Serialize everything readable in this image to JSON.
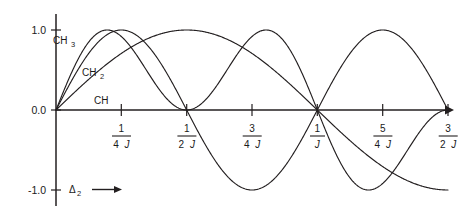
{
  "chart_data": {
    "type": "line",
    "title": "",
    "xlabel": "Δ₂",
    "ylabel": "",
    "xlim": [
      0,
      1.5
    ],
    "ylim": [
      -1.25,
      1.25
    ],
    "grid": false,
    "legend": "inline-curve-labels",
    "x_unit": "1/J",
    "x_tick_labels": [
      "1/4J",
      "1/2J",
      "3/4J",
      "1/J",
      "5/4J",
      "3/2J"
    ],
    "x_tick_values": [
      0.25,
      0.5,
      0.75,
      1.0,
      1.25,
      1.5
    ],
    "y_tick_labels": [
      "1.0",
      "0.0",
      "-1.0"
    ],
    "y_tick_values": [
      1.0,
      0.0,
      -1.0
    ],
    "series": [
      {
        "name": "CH",
        "formula": "sin(pi*J*D)",
        "peak_value": 1.0,
        "peak_x": "1/2J",
        "zero_crossings": [
          "0",
          "1/J"
        ],
        "min_value": -1.0,
        "min_x": "3/2J"
      },
      {
        "name": "CH2",
        "formula": "sin(2*pi*J*D)",
        "peak_value": 1.0,
        "peak_x": "1/4J",
        "zero_crossings": [
          "0",
          "1/2J",
          "1/J",
          "3/2J"
        ],
        "min_value": -1.0,
        "min_x": "3/4J"
      },
      {
        "name": "CH3",
        "formula": "sin(pi*J*D)*cos(pi*J*D)^2 scaled",
        "peak_value": 1.15,
        "peak_x": "~0.2/J",
        "zero_crossings": [
          "0",
          "1/2J",
          "1/J",
          "3/2J"
        ],
        "min_value": -1.15,
        "min_x": "~1.3/J"
      }
    ]
  },
  "axis": {
    "y_labels": [
      "1.0",
      "0.0",
      "-1.0"
    ],
    "x_axis_name": "Δ",
    "x_axis_subscript": "2",
    "x_axis_arrow": "⟶"
  },
  "ticks": [
    {
      "num": "1",
      "den_num": "4",
      "den_J": "J"
    },
    {
      "num": "1",
      "den_num": "2",
      "den_J": "J"
    },
    {
      "num": "3",
      "den_num": "4",
      "den_J": "J"
    },
    {
      "num": "1",
      "den_num": "",
      "den_J": "J"
    },
    {
      "num": "5",
      "den_num": "4",
      "den_J": "J"
    },
    {
      "num": "3",
      "den_num": "2",
      "den_J": "J"
    }
  ],
  "curve_labels": [
    {
      "text": "CH",
      "sub": "3"
    },
    {
      "text": "CH",
      "sub": "2"
    },
    {
      "text": "CH",
      "sub": ""
    }
  ],
  "colors": {
    "ink": "#231f20",
    "background": "#ffffff"
  }
}
